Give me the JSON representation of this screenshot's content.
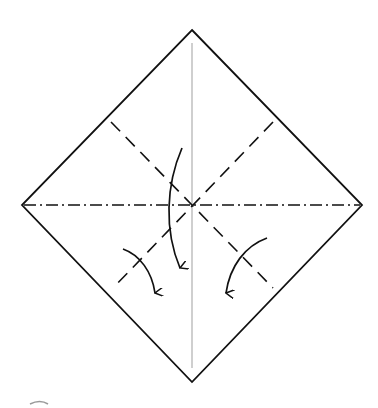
{
  "diagram": {
    "type": "origami-fold-diagram",
    "colors": {
      "background": "#ffffff",
      "stroke": "#111111",
      "center_line": "#b5b5b5",
      "fade_mark": "#9a9a9a"
    },
    "paper": {
      "shape": "square rotated 45deg (diamond)",
      "vertices": {
        "top": [
          192,
          30
        ],
        "right": [
          362,
          205
        ],
        "bottom": [
          192,
          382
        ],
        "left": [
          22,
          205
        ]
      }
    },
    "creases": [
      {
        "name": "center-vertical-crease",
        "style": "existing crease (thin gray)",
        "from": [
          192,
          43
        ],
        "to": [
          192,
          368
        ]
      },
      {
        "name": "horizontal-mountain-fold",
        "style": "dash-dot",
        "from": [
          22,
          205
        ],
        "to": [
          362,
          205
        ]
      },
      {
        "name": "diagonal-valley-fold-1",
        "style": "dashed",
        "from": [
          111,
          122
        ],
        "to": [
          273,
          288
        ]
      },
      {
        "name": "diagonal-valley-fold-2",
        "style": "dashed",
        "from": [
          273,
          122
        ],
        "to": [
          113,
          288
        ]
      }
    ],
    "arrows": [
      {
        "name": "center-fold-arrow",
        "direction": "down",
        "from": [
          182,
          148
        ],
        "to": [
          180,
          270
        ]
      },
      {
        "name": "left-fold-arrow",
        "direction": "down-right",
        "from": [
          123,
          249
        ],
        "to": [
          155,
          295
        ]
      },
      {
        "name": "right-fold-arrow",
        "direction": "down-left",
        "from": [
          267,
          238
        ],
        "to": [
          226,
          295
        ]
      }
    ]
  }
}
